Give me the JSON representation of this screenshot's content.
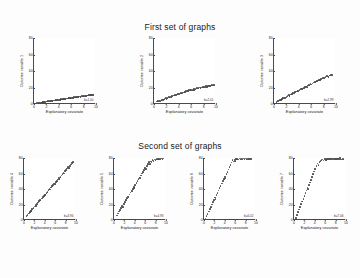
{
  "figure": {
    "background": "#fdfdfd",
    "point_color": "#4d4d4d",
    "axis_color": "#4a4a4a"
  },
  "rows": [
    {
      "title": "First set of graphs",
      "panel_count": 3
    },
    {
      "title": "Second set of graphs",
      "panel_count": 4
    }
  ],
  "chart_data": [
    {
      "type": "scatter",
      "title": "First set of graphs",
      "panel_index": 1,
      "xlabel": "Explanatory covariate",
      "ylabel": "Outcome variable 1",
      "xlim": [
        0,
        10
      ],
      "ylim": [
        0,
        80
      ],
      "xticks": [
        0,
        2,
        4,
        6,
        8,
        10
      ],
      "yticks": [
        0,
        20,
        40,
        60,
        80
      ],
      "annotation": "b=1.00",
      "grid": false,
      "x": [
        0.4,
        0.6,
        0.8,
        0.9,
        1.1,
        1.2,
        1.4,
        1.5,
        1.7,
        1.8,
        2.0,
        2.1,
        2.3,
        2.4,
        2.6,
        2.7,
        2.9,
        3.0,
        3.2,
        3.3,
        3.5,
        3.6,
        3.8,
        3.9,
        4.1,
        4.2,
        4.4,
        4.5,
        4.7,
        4.8,
        5.0,
        5.1,
        5.3,
        5.4,
        5.6,
        5.7,
        5.9,
        6.0,
        6.2,
        6.3,
        6.5,
        6.6,
        6.8,
        6.9,
        7.1,
        7.2,
        7.4,
        7.5,
        7.7,
        7.8,
        8.0,
        8.1,
        8.3,
        8.4,
        8.6,
        8.7,
        8.9,
        9.0,
        9.2,
        9.3,
        9.5,
        9.6
      ],
      "y": [
        1.2,
        1.4,
        1.3,
        1.8,
        2.0,
        1.9,
        2.4,
        2.2,
        2.8,
        2.6,
        3.1,
        3.0,
        3.4,
        3.2,
        3.8,
        3.6,
        4.1,
        3.9,
        4.4,
        4.2,
        4.7,
        4.6,
        5.1,
        4.9,
        5.4,
        5.2,
        5.7,
        5.6,
        6.1,
        5.9,
        6.4,
        6.2,
        6.7,
        6.6,
        7.1,
        6.9,
        7.4,
        7.2,
        7.7,
        7.6,
        8.1,
        7.9,
        8.4,
        8.2,
        8.7,
        8.6,
        9.1,
        8.9,
        9.4,
        9.2,
        9.7,
        9.6,
        10.1,
        9.9,
        10.4,
        10.2,
        10.7,
        10.6,
        11.1,
        10.9,
        11.4,
        11.2
      ]
    },
    {
      "type": "scatter",
      "title": "First set of graphs",
      "panel_index": 2,
      "xlabel": "Explanatory covariate",
      "ylabel": "Outcome variable 2",
      "xlim": [
        0,
        10
      ],
      "ylim": [
        0,
        80
      ],
      "xticks": [
        0,
        2,
        4,
        6,
        8,
        10
      ],
      "yticks": [
        0,
        20,
        40,
        60,
        80
      ],
      "annotation": "b=2.01",
      "grid": false,
      "x": [
        0.5,
        0.7,
        0.9,
        1.0,
        1.2,
        1.4,
        1.5,
        1.7,
        1.9,
        2.0,
        2.2,
        2.4,
        2.5,
        2.7,
        2.9,
        3.0,
        3.2,
        3.4,
        3.5,
        3.7,
        3.9,
        4.0,
        4.2,
        4.4,
        4.5,
        4.7,
        4.9,
        5.0,
        5.2,
        5.4,
        5.5,
        5.7,
        5.9,
        6.0,
        6.2,
        6.4,
        6.5,
        6.7,
        6.9,
        7.0,
        7.2,
        7.4,
        7.5,
        7.7,
        7.9,
        8.0,
        8.2,
        8.4,
        8.5,
        8.7,
        8.9,
        9.0,
        9.2,
        9.4,
        9.5,
        9.7
      ],
      "y": [
        3.0,
        3.6,
        4.2,
        3.9,
        5.1,
        5.6,
        4.9,
        6.3,
        6.9,
        6.4,
        7.6,
        8.2,
        7.7,
        8.9,
        9.5,
        9.0,
        10.2,
        10.8,
        10.3,
        11.5,
        12.1,
        11.6,
        12.8,
        13.4,
        12.9,
        14.1,
        14.7,
        14.2,
        15.4,
        16.0,
        15.5,
        16.7,
        17.3,
        16.8,
        17.0,
        17.8,
        17.3,
        18.5,
        19.1,
        18.6,
        19.3,
        19.9,
        19.4,
        20.1,
        20.7,
        20.2,
        20.9,
        21.5,
        21.0,
        21.7,
        22.3,
        21.8,
        22.5,
        23.1,
        22.6,
        23.3
      ]
    },
    {
      "type": "scatter",
      "title": "First set of graphs",
      "panel_index": 3,
      "xlabel": "Explanatory covariate",
      "ylabel": "Outcome variable 3",
      "xlim": [
        0,
        10
      ],
      "ylim": [
        0,
        80
      ],
      "xticks": [
        0,
        2,
        4,
        6,
        8,
        10
      ],
      "yticks": [
        0,
        20,
        40,
        60,
        80
      ],
      "annotation": "b=2.99",
      "grid": false,
      "x": [
        0.4,
        0.6,
        0.8,
        1.0,
        1.1,
        1.3,
        1.5,
        1.7,
        1.8,
        2.0,
        2.2,
        2.4,
        2.5,
        2.7,
        2.9,
        3.1,
        3.2,
        3.4,
        3.6,
        3.8,
        3.9,
        4.1,
        4.3,
        4.5,
        4.6,
        4.8,
        5.0,
        5.2,
        5.3,
        5.5,
        5.7,
        5.9,
        6.0,
        6.2,
        6.4,
        6.6,
        6.7,
        6.9,
        7.1,
        7.3,
        7.4,
        7.6,
        7.8,
        8.0,
        8.1,
        8.3,
        8.5,
        8.7,
        8.8,
        9.0,
        9.2,
        9.4
      ],
      "y": [
        2.5,
        3.4,
        4.3,
        5.2,
        4.7,
        6.1,
        7.0,
        7.9,
        7.4,
        8.8,
        9.7,
        10.6,
        10.1,
        11.5,
        12.4,
        13.3,
        12.8,
        14.2,
        15.1,
        16.0,
        15.5,
        16.9,
        17.8,
        18.7,
        18.2,
        19.6,
        20.5,
        21.4,
        20.9,
        22.3,
        23.2,
        24.1,
        23.6,
        25.0,
        25.9,
        26.8,
        26.3,
        27.7,
        28.6,
        29.5,
        29.0,
        30.4,
        31.3,
        32.2,
        31.7,
        33.1,
        34.0,
        33.5,
        32.9,
        34.4,
        35.3,
        34.8
      ]
    },
    {
      "type": "scatter",
      "title": "Second set of graphs",
      "panel_index": 4,
      "xlabel": "Explanatory covariate",
      "ylabel": "Outcome variable 4",
      "xlim": [
        0,
        10
      ],
      "ylim": [
        0,
        80
      ],
      "xticks": [
        0,
        2,
        4,
        6,
        8,
        10
      ],
      "yticks": [
        0,
        20,
        40,
        60,
        80
      ],
      "annotation": "b=3.94",
      "grid": false,
      "x": [
        0.5,
        0.7,
        0.9,
        1.1,
        1.3,
        1.4,
        1.6,
        1.8,
        2.0,
        2.2,
        2.3,
        2.5,
        2.7,
        2.9,
        3.1,
        3.2,
        3.4,
        3.6,
        3.8,
        4.0,
        4.1,
        4.3,
        4.5,
        4.7,
        4.9,
        5.0,
        5.2,
        5.4,
        5.6,
        5.8,
        5.9,
        6.1,
        6.3,
        6.5,
        6.7,
        6.8,
        7.0,
        7.2,
        7.4,
        7.6,
        7.7,
        7.9,
        8.1,
        8.3,
        8.5,
        8.6,
        8.8,
        9.0,
        9.2,
        9.4
      ],
      "y": [
        5.0,
        6.8,
        8.5,
        10.3,
        12.0,
        11.2,
        13.8,
        15.5,
        17.3,
        19.0,
        18.2,
        20.8,
        22.5,
        24.3,
        26.0,
        25.2,
        27.8,
        29.5,
        31.3,
        33.0,
        32.2,
        34.8,
        36.5,
        38.3,
        40.0,
        39.2,
        41.8,
        43.5,
        45.3,
        47.0,
        46.2,
        48.8,
        50.5,
        52.3,
        54.0,
        53.2,
        55.8,
        57.5,
        59.3,
        61.0,
        60.2,
        62.8,
        64.5,
        66.3,
        68.0,
        67.2,
        69.8,
        71.5,
        73.3,
        75.0
      ]
    },
    {
      "type": "scatter",
      "title": "Second set of graphs",
      "panel_index": 5,
      "xlabel": "Explanatory covariate",
      "ylabel": "Outcome variable 5",
      "xlim": [
        0,
        10
      ],
      "ylim": [
        0,
        80
      ],
      "xticks": [
        0,
        2,
        4,
        6,
        8,
        10
      ],
      "yticks": [
        0,
        20,
        40,
        60,
        80
      ],
      "annotation": "b=4.93",
      "grid": false,
      "x": [
        0.6,
        0.8,
        1.0,
        1.2,
        1.4,
        1.6,
        1.7,
        1.9,
        2.1,
        2.3,
        2.5,
        2.7,
        2.8,
        3.0,
        3.2,
        3.4,
        3.6,
        3.8,
        3.9,
        4.1,
        4.3,
        4.5,
        4.7,
        4.9,
        5.0,
        5.2,
        5.4,
        5.6,
        5.8,
        6.0,
        6.1,
        6.3,
        6.5,
        6.7,
        6.9,
        7.1,
        7.2,
        7.4,
        7.6,
        7.8,
        8.0,
        8.2,
        8.3,
        8.5,
        8.7,
        8.9,
        9.1,
        9.3,
        9.5
      ],
      "y": [
        6.0,
        8.4,
        10.9,
        13.3,
        15.8,
        18.2,
        17.0,
        20.7,
        23.1,
        25.6,
        28.0,
        30.5,
        29.3,
        32.9,
        35.4,
        37.8,
        40.3,
        42.7,
        41.5,
        45.2,
        47.6,
        50.1,
        52.5,
        55.0,
        53.8,
        57.4,
        59.9,
        62.3,
        64.8,
        67.2,
        66.0,
        69.7,
        72.1,
        74.6,
        72.0,
        75.5,
        74.3,
        77.0,
        76.2,
        78.1,
        77.5,
        78.8,
        77.9,
        78.5,
        79.0,
        78.2,
        79.3,
        78.7,
        79.5
      ]
    },
    {
      "type": "scatter",
      "title": "Second set of graphs",
      "panel_index": 6,
      "xlabel": "Explanatory covariate",
      "ylabel": "Outcome variable 6",
      "xlim": [
        0,
        10
      ],
      "ylim": [
        0,
        80
      ],
      "xticks": [
        0,
        2,
        4,
        6,
        8,
        10
      ],
      "yticks": [
        0,
        20,
        40,
        60,
        80
      ],
      "annotation": "b=6.02",
      "grid": false,
      "x": [
        0.3,
        0.5,
        0.7,
        0.9,
        1.1,
        1.3,
        1.5,
        1.7,
        1.9,
        2.1,
        2.2,
        2.4,
        2.6,
        2.8,
        3.0,
        3.2,
        3.4,
        3.6,
        3.8,
        4.0,
        4.1,
        4.3,
        4.5,
        4.7,
        4.9,
        5.1,
        5.3,
        5.5,
        5.7,
        5.9,
        6.0,
        6.2,
        6.4,
        6.6,
        6.8,
        7.0,
        7.2,
        7.4,
        7.6,
        7.8,
        8.0,
        8.2,
        8.4,
        8.6,
        8.8,
        9.0
      ],
      "y": [
        2.0,
        5.0,
        8.0,
        11.0,
        14.0,
        17.0,
        20.0,
        23.0,
        26.0,
        29.0,
        27.5,
        32.0,
        35.0,
        38.0,
        41.0,
        44.0,
        47.0,
        50.0,
        53.0,
        56.0,
        54.5,
        59.0,
        62.0,
        65.0,
        68.0,
        71.0,
        74.0,
        77.0,
        75.5,
        78.0,
        76.5,
        78.5,
        79.0,
        78.2,
        79.3,
        78.8,
        79.1,
        78.6,
        79.4,
        78.9,
        79.2,
        78.4,
        79.0,
        78.7,
        79.3,
        78.5
      ]
    },
    {
      "type": "scatter",
      "title": "Second set of graphs",
      "panel_index": 7,
      "xlabel": "Explanatory covariate",
      "ylabel": "Outcome variable 7",
      "xlim": [
        0,
        10
      ],
      "ylim": [
        0,
        80
      ],
      "xticks": [
        0,
        2,
        4,
        6,
        8,
        10
      ],
      "yticks": [
        0,
        20,
        40,
        60,
        80
      ],
      "annotation": "b=7.06",
      "grid": false,
      "x": [
        0.4,
        0.6,
        0.8,
        1.0,
        1.2,
        1.4,
        1.6,
        1.8,
        2.0,
        2.2,
        2.4,
        2.6,
        2.7,
        2.9,
        3.1,
        3.3,
        3.5,
        3.7,
        3.9,
        4.1,
        4.3,
        4.5,
        4.7,
        4.9,
        5.1,
        5.3,
        5.5,
        5.7,
        5.9,
        6.1,
        6.3,
        6.5,
        6.7,
        6.9,
        7.1,
        7.3,
        7.5,
        7.7,
        7.9,
        8.1,
        8.3,
        8.5,
        8.7,
        8.9,
        9.1,
        9.3,
        9.5
      ],
      "y": [
        3.0,
        6.5,
        10.0,
        13.5,
        17.0,
        20.5,
        24.0,
        27.5,
        31.0,
        34.5,
        38.0,
        41.5,
        39.8,
        45.0,
        48.5,
        52.0,
        55.5,
        59.0,
        62.5,
        66.0,
        69.5,
        73.0,
        71.3,
        74.8,
        76.2,
        77.5,
        78.0,
        76.8,
        78.5,
        77.2,
        78.8,
        79.0,
        78.3,
        79.2,
        78.6,
        79.4,
        78.1,
        79.5,
        78.9,
        79.1,
        78.4,
        79.3,
        78.7,
        79.6,
        78.2,
        79.0,
        78.8
      ]
    }
  ]
}
